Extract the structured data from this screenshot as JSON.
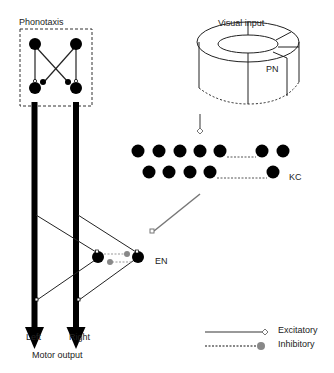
{
  "labels": {
    "phonotaxis": "Phonotaxis",
    "visual_input": "Visual input",
    "pn": "PN",
    "kc": "KC",
    "en": "EN",
    "left": "Left",
    "right": "Right",
    "motor_output": "Motor output"
  },
  "legend": {
    "excitatory": "Excitatory",
    "inhibitory": "Inhibitory"
  },
  "colors": {
    "neuron": "#000000",
    "excitatory_line": "#777777",
    "inhibitory_dot": "#888888",
    "thin_line": "#333333"
  }
}
